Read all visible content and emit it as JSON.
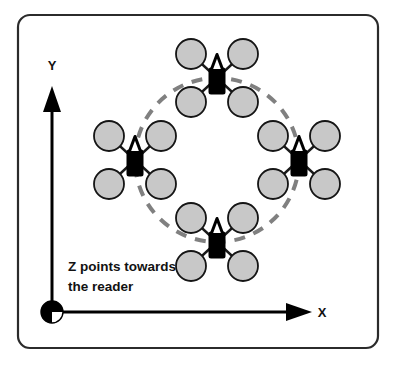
{
  "figure": {
    "name": "quadrotor-circular-formation-diagram",
    "background_color": "#ffffff",
    "frame": {
      "name": "rounded-rectangle-border",
      "x": 18,
      "y": 15,
      "width": 360,
      "height": 333,
      "corner_radius": 12,
      "stroke_color": "#2b2b2b",
      "stroke_width": 2.2
    }
  },
  "axes": {
    "origin": {
      "x": 52,
      "y": 312
    },
    "x_axis": {
      "label": "X",
      "label_x": 322,
      "label_y": 317,
      "line_from_x": 52,
      "line_to_x": 296,
      "line_y": 312,
      "arrow_tip_x": 312,
      "color": "#000000",
      "stroke_width": 3
    },
    "y_axis": {
      "label": "Y",
      "label_x": 52,
      "label_y": 70,
      "line_from_y": 312,
      "line_to_y": 104,
      "line_x": 52,
      "arrow_tip_y": 86,
      "color": "#000000",
      "stroke_width": 3
    },
    "z_axis": {
      "marker_name": "z-out-of-page-symbol",
      "marker_x": 52,
      "marker_y": 312,
      "marker_radius": 11,
      "fill_color": "#000000",
      "quadrant_fill_color": "#ffffff",
      "note_line_1": "Z points towards",
      "note_line_2": "the reader",
      "note_x": 68,
      "note_line_1_y": 271,
      "note_line_2_y": 291
    }
  },
  "formation": {
    "name": "dashed-formation-circle",
    "center_x": 217,
    "center_y": 160,
    "radius": 82,
    "stroke_color": "#808080",
    "stroke_width": 4,
    "dash_pattern": "11 9"
  },
  "chart_data": {
    "type": "scatter",
    "xlabel": "X",
    "ylabel": "Y",
    "legend": [],
    "grid": false,
    "annotations": [
      "Z points towards the reader",
      "X",
      "Y"
    ],
    "reference_shape": {
      "kind": "circle",
      "center": [
        217,
        160
      ],
      "radius": 82,
      "style": "dashed",
      "color": "#808080"
    },
    "series": [
      {
        "name": "quadrotors",
        "marker": "quadcopter",
        "points": [
          {
            "label": "top",
            "x": 217,
            "y": 78,
            "heading_deg": 0
          },
          {
            "label": "left",
            "x": 135,
            "y": 160,
            "heading_deg": 0
          },
          {
            "label": "right",
            "x": 299,
            "y": 160,
            "heading_deg": 0
          },
          {
            "label": "bottom",
            "x": 217,
            "y": 242,
            "heading_deg": 0
          }
        ]
      }
    ]
  },
  "quadrotor_style": {
    "body_color": "#000000",
    "nose_fill_color": "#ffffff",
    "nose_stroke_color": "#000000",
    "arm_color": "#1a1a1a",
    "arm_width": 2.4,
    "rotor_fill_color": "#c8c8c8",
    "rotor_stroke_color": "#151515",
    "rotor_stroke_width": 1.8,
    "rotor_radius": 15,
    "body_width": 17,
    "body_height": 27,
    "arm_offset_x": 26,
    "arm_offset_y": 24
  }
}
